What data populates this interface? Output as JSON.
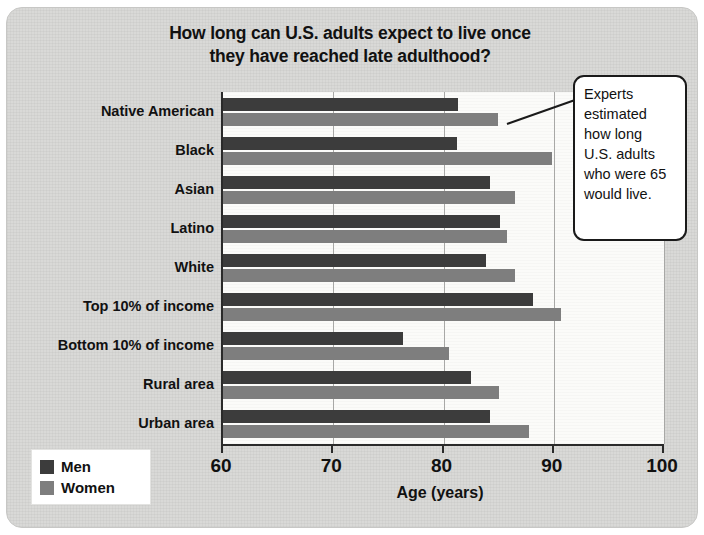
{
  "chart_data": {
    "type": "bar",
    "orientation": "horizontal",
    "title": "How long can U.S. adults expect to live once they have reached late adulthood?",
    "title_line1": "How long can U.S. adults expect to live once",
    "title_line2": "they have reached late adulthood?",
    "xlabel": "Age (years)",
    "ylabel": "",
    "xlim": [
      60,
      100
    ],
    "xticks": [
      60,
      70,
      80,
      90,
      100
    ],
    "xtick_labels": [
      "60",
      "70",
      "80",
      "90",
      "100"
    ],
    "grid": true,
    "grid_axis": "x",
    "legend_position": "bottom-left",
    "categories": [
      "Native American",
      "Black",
      "Asian",
      "Latino",
      "White",
      "Top 10% of income",
      "Bottom 10% of income",
      "Rural area",
      "Urban area"
    ],
    "series": [
      {
        "name": "Men",
        "color": "#3c3c3c",
        "values": [
          81.3,
          81.2,
          84.2,
          85.1,
          83.9,
          88.1,
          76.3,
          82.5,
          84.2
        ]
      },
      {
        "name": "Women",
        "color": "#7e7e7e",
        "values": [
          84.9,
          89.8,
          86.5,
          85.8,
          86.5,
          90.7,
          80.5,
          85.0,
          87.8
        ]
      }
    ],
    "annotations": [
      {
        "name": "callout",
        "text": "Experts estimated how long U.S. adults who were 65 would live.",
        "lines": [
          "Experts",
          "estimated",
          "how long",
          "U.S. adults",
          "who were 65",
          "would live."
        ]
      }
    ]
  },
  "legend": {
    "items": [
      {
        "label": "Men",
        "color": "#3c3c3c"
      },
      {
        "label": "Women",
        "color": "#7e7e7e"
      }
    ]
  },
  "colors": {
    "panel_background": "#d9d9d7",
    "plot_background": "#fbfbf9",
    "axis": "#2a2a2a",
    "gridline": "#a8a8a6",
    "text": "#111111",
    "men_bar": "#3c3c3c",
    "women_bar": "#7e7e7e"
  }
}
